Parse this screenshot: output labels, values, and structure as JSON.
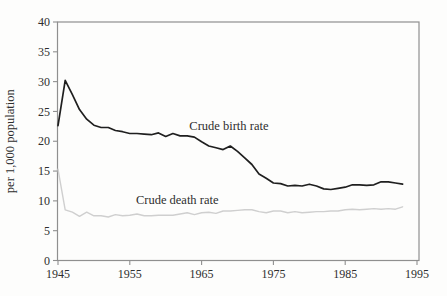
{
  "chart_data": {
    "type": "line",
    "title": "",
    "xlabel": "",
    "ylabel": "per 1,000 population",
    "xlim": [
      1945,
      1995
    ],
    "ylim": [
      0,
      40
    ],
    "x_ticks": [
      1945,
      1955,
      1965,
      1975,
      1985,
      1995
    ],
    "y_ticks": [
      0,
      5,
      10,
      15,
      20,
      25,
      30,
      35,
      40
    ],
    "grid": false,
    "legend": "inline-annotations",
    "axis_color": "#8f8f8f",
    "text_color": "#2e2e2e",
    "x": [
      1945,
      1946,
      1947,
      1948,
      1949,
      1950,
      1951,
      1952,
      1953,
      1954,
      1955,
      1956,
      1957,
      1958,
      1959,
      1960,
      1961,
      1962,
      1963,
      1964,
      1965,
      1966,
      1967,
      1968,
      1969,
      1970,
      1971,
      1972,
      1973,
      1974,
      1975,
      1976,
      1977,
      1978,
      1979,
      1980,
      1981,
      1982,
      1983,
      1984,
      1985,
      1986,
      1987,
      1988,
      1989,
      1990,
      1991,
      1992,
      1993
    ],
    "series": [
      {
        "name": "Crude birth rate",
        "color": "#1f1f1f",
        "width": 1.7,
        "values": [
          22.6,
          30.2,
          27.8,
          25.3,
          23.7,
          22.7,
          22.3,
          22.3,
          21.8,
          21.6,
          21.3,
          21.3,
          21.2,
          21.1,
          21.4,
          20.8,
          21.3,
          20.9,
          20.9,
          20.7,
          19.9,
          19.2,
          18.9,
          18.6,
          19.2,
          18.3,
          17.2,
          16.1,
          14.5,
          13.8,
          13.0,
          12.9,
          12.5,
          12.6,
          12.5,
          12.8,
          12.5,
          12.0,
          11.9,
          12.1,
          12.3,
          12.7,
          12.7,
          12.6,
          12.7,
          13.2,
          13.2,
          13.0,
          12.8
        ]
      },
      {
        "name": "Crude death rate",
        "color": "#cfcfcf",
        "width": 1.4,
        "values": [
          15.3,
          8.5,
          8.1,
          7.4,
          8.1,
          7.5,
          7.5,
          7.3,
          7.7,
          7.5,
          7.6,
          7.8,
          7.5,
          7.5,
          7.6,
          7.6,
          7.6,
          7.8,
          8.0,
          7.7,
          8.0,
          8.1,
          7.9,
          8.3,
          8.3,
          8.4,
          8.5,
          8.5,
          8.2,
          8.0,
          8.3,
          8.3,
          8.0,
          8.2,
          8.0,
          8.1,
          8.2,
          8.2,
          8.3,
          8.3,
          8.5,
          8.6,
          8.5,
          8.6,
          8.7,
          8.6,
          8.7,
          8.6,
          9.0
        ]
      }
    ],
    "annotations": [
      {
        "label": "Crude birth rate",
        "x": 1968.8,
        "y": 22.6
      },
      {
        "label": "Crude death rate",
        "x": 1961.6,
        "y": 10.2
      }
    ]
  }
}
